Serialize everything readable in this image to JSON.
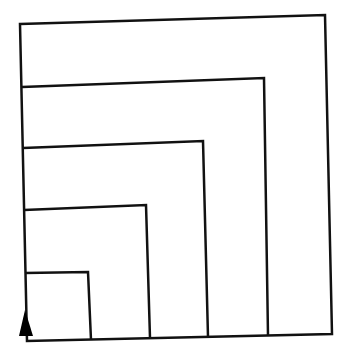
{
  "diagram": {
    "stroke_color": "#111111",
    "background": "#ffffff",
    "squares": [
      {
        "name": "square-1",
        "points": "20,24 325,15 332,334 27,341"
      },
      {
        "name": "square-2",
        "points": "22,87 264,78 268,336"
      },
      {
        "name": "square-3",
        "points": "23,148 203,141 208,337"
      },
      {
        "name": "square-4",
        "points": "24,210 146,205 150,338"
      },
      {
        "name": "square-5",
        "points": "25,273 88,272 91,340"
      }
    ],
    "arrow": {
      "points": "20,322 27,322 30,338 17,338"
    }
  }
}
